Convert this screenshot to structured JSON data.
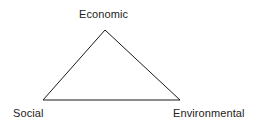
{
  "diagram": {
    "type": "triangle",
    "vertices": {
      "top": {
        "label": "Economic",
        "x": 105,
        "y": 30
      },
      "bottom_left": {
        "label": "Social",
        "x": 43,
        "y": 100
      },
      "bottom_right": {
        "label": "Environmental",
        "x": 180,
        "y": 100
      }
    },
    "stroke_color": "#1a1a1a",
    "label_color": "#222222"
  }
}
